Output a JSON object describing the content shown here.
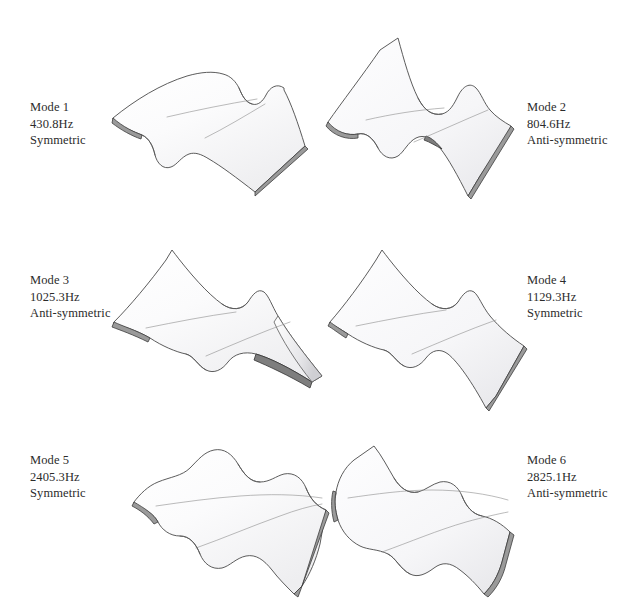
{
  "figure": {
    "background_color": "#ffffff",
    "columns": 2,
    "rows": 3,
    "label_color": "#2b2b2b",
    "surface_fill": "#fcfcfd",
    "outline_color": "#4a4a4a",
    "edge_shade_color": "#9a9a9a"
  },
  "modes": [
    {
      "id": "mode-1",
      "name": "Mode 1",
      "frequency": "430.8Hz",
      "symmetry": "Symmetric",
      "frequency_hz": 430.8,
      "label_side": "left",
      "shape": "single-fold bending, gentle S-curve across the span"
    },
    {
      "id": "mode-2",
      "name": "Mode 2",
      "frequency": "804.6Hz",
      "symmetry": "Anti-symmetric",
      "frequency_hz": 804.6,
      "label_side": "right",
      "shape": "anti-symmetric twist with central pinch"
    },
    {
      "id": "mode-3",
      "name": "Mode 3",
      "frequency": "1025.3Hz",
      "symmetry": "Anti-symmetric",
      "frequency_hz": 1025.3,
      "label_side": "left",
      "shape": "torsional mode, strongly tapered tip deflection"
    },
    {
      "id": "mode-4",
      "name": "Mode 4",
      "frequency": "1129.3Hz",
      "symmetry": "Symmetric",
      "frequency_hz": 1129.3,
      "label_side": "right",
      "shape": "symmetric hourglass / bowtie bending"
    },
    {
      "id": "mode-5",
      "name": "Mode 5",
      "frequency": "2405.3Hz",
      "symmetry": "Symmetric",
      "frequency_hz": 2405.3,
      "label_side": "left",
      "shape": "multi-wave corrugation, three half-waves"
    },
    {
      "id": "mode-6",
      "name": "Mode 6",
      "frequency": "2825.1Hz",
      "symmetry": "Anti-symmetric",
      "frequency_hz": 2825.1,
      "label_side": "right",
      "shape": "anti-symmetric multi-wave corrugation"
    }
  ]
}
